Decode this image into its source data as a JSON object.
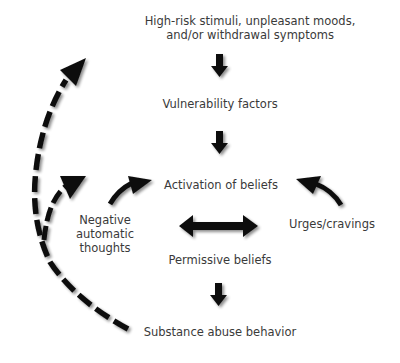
{
  "diagram": {
    "nodes": {
      "stimuli_line1": "High-risk stimuli, unpleasant moods,",
      "stimuli_line2": "and/or withdrawal symptoms",
      "vulnerability": "Vulnerability factors",
      "activation": "Activation of beliefs",
      "negative_line1": "Negative",
      "negative_line2": "automatic",
      "negative_line3": "thoughts",
      "urges": "Urges/cravings",
      "permissive": "Permissive beliefs",
      "substance": "Substance abuse behavior"
    },
    "colors": {
      "arrow": "#111111",
      "text": "#3a3a3a",
      "background": "#ffffff"
    }
  }
}
